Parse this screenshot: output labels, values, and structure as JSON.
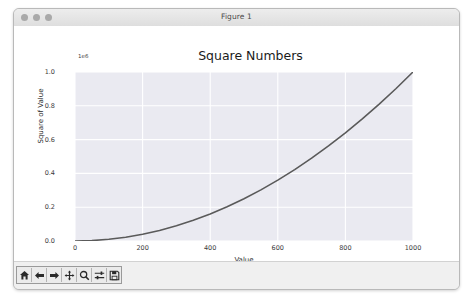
{
  "window": {
    "title": "Figure 1",
    "traffic_lights": [
      "close",
      "minimize",
      "zoom"
    ]
  },
  "chart_data": {
    "type": "line",
    "title": "Square Numbers",
    "xlabel": "Value",
    "ylabel": "Square of Value",
    "y_offset_text": "1e6",
    "xlim": [
      0,
      1000
    ],
    "ylim": [
      0,
      1000000
    ],
    "xticks": [
      "0",
      "200",
      "400",
      "600",
      "800",
      "1000"
    ],
    "xtick_values": [
      0,
      200,
      400,
      600,
      800,
      1000
    ],
    "yticks": [
      "0.0",
      "0.2",
      "0.4",
      "0.6",
      "0.8",
      "1.0"
    ],
    "ytick_values": [
      0,
      200000,
      400000,
      600000,
      800000,
      1000000
    ],
    "grid": true,
    "legend": "none",
    "line_color": "#5a5a5a",
    "axes_bg": "#eaeaf1",
    "series": [
      {
        "name": "Square of Value",
        "x": [
          0,
          50,
          100,
          150,
          200,
          250,
          300,
          350,
          400,
          450,
          500,
          550,
          600,
          650,
          700,
          750,
          800,
          850,
          900,
          950,
          1000
        ],
        "values": [
          0,
          2500,
          10000,
          22500,
          40000,
          62500,
          90000,
          122500,
          160000,
          202500,
          250000,
          302500,
          360000,
          422500,
          490000,
          562500,
          640000,
          722500,
          810000,
          902500,
          1000000
        ]
      }
    ]
  },
  "toolbar": {
    "buttons": [
      {
        "name": "home",
        "label": "Home"
      },
      {
        "name": "back",
        "label": "Back"
      },
      {
        "name": "forward",
        "label": "Forward"
      },
      {
        "name": "pan",
        "label": "Pan"
      },
      {
        "name": "zoom",
        "label": "Zoom"
      },
      {
        "name": "configure-subplots",
        "label": "Configure subplots"
      },
      {
        "name": "save",
        "label": "Save figure"
      }
    ]
  }
}
